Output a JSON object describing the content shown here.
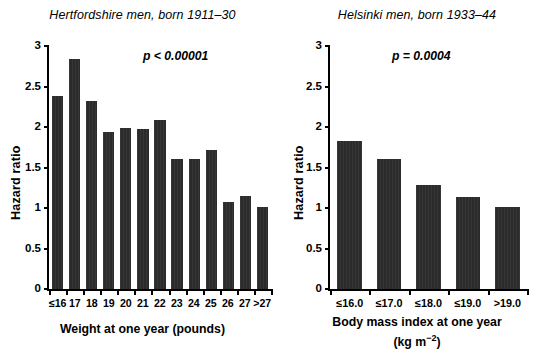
{
  "figure": {
    "background": "#ffffff",
    "bar_color": "#2b2b2b",
    "axis_color": "#000000"
  },
  "panels": [
    {
      "id": "hertfordshire",
      "title": "Hertfordshire men, born 1911–30",
      "pvalue": "p < 0.00001",
      "ylabel": "Hazard ratio",
      "xcaption": "Weight at one year (pounds)",
      "xcaption_line2": "",
      "yticks": [
        "0",
        "0.5",
        "1",
        "1.5",
        "2",
        "2.5",
        "3"
      ]
    },
    {
      "id": "helsinki",
      "title": "Helsinki men, born 1933–44",
      "pvalue": "p = 0.0004",
      "ylabel": "Hazard ratio",
      "xcaption": "Body mass index at one year",
      "xcaption_line2": "(kg m",
      "xcaption_sup": "−2",
      "xcaption_line2_end": ")",
      "yticks": [
        "0",
        "0.5",
        "1",
        "1.5",
        "2",
        "2.5",
        "3"
      ]
    }
  ],
  "chart_data": [
    {
      "type": "bar",
      "title": "Hertfordshire men, born 1911–30",
      "xlabel": "Weight at one year (pounds)",
      "ylabel": "Hazard ratio",
      "ylim": [
        0,
        3
      ],
      "yticks": [
        0,
        0.5,
        1,
        1.5,
        2,
        2.5,
        3
      ],
      "grid": false,
      "legend": "none",
      "annotation": "p < 0.00001",
      "categories": [
        "≤16",
        "17",
        "18",
        "19",
        "20",
        "21",
        "22",
        "23",
        "24",
        "25",
        "26",
        "27",
        ">27"
      ],
      "values": [
        2.38,
        2.84,
        2.32,
        1.94,
        1.99,
        1.97,
        2.09,
        1.6,
        1.61,
        1.72,
        1.07,
        1.15,
        1.01
      ]
    },
    {
      "type": "bar",
      "title": "Helsinki men, born 1933–44",
      "xlabel": "Body mass index at one year (kg m−2)",
      "ylabel": "Hazard ratio",
      "ylim": [
        0,
        3
      ],
      "yticks": [
        0,
        0.5,
        1,
        1.5,
        2,
        2.5,
        3
      ],
      "grid": false,
      "legend": "none",
      "annotation": "p = 0.0004",
      "categories": [
        "≤16.0",
        "≤17.0",
        "≤18.0",
        "≤19.0",
        ">19.0"
      ],
      "values": [
        1.83,
        1.6,
        1.29,
        1.13,
        1.01
      ]
    }
  ]
}
